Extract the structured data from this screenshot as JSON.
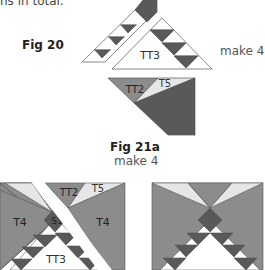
{
  "intro_text": "ns in total.",
  "fig20": {
    "label": "Fig 20",
    "make": "make 4",
    "pieces": {
      "tt3": "TT3",
      "tt2": "TT2",
      "t5": "T5"
    }
  },
  "fig21a": {
    "label": "Fig 21a",
    "make": "make 4",
    "pieces": {
      "t4_left": "T4",
      "s1": "S1",
      "tt2": "TT2",
      "t5": "T5",
      "t4_right": "T4",
      "tt3": "TT3"
    }
  },
  "colors": {
    "dark": "#595959",
    "medium": "#8c8c8c",
    "light": "#e6e6e6",
    "white": "#ffffff",
    "outline": "#555555"
  }
}
